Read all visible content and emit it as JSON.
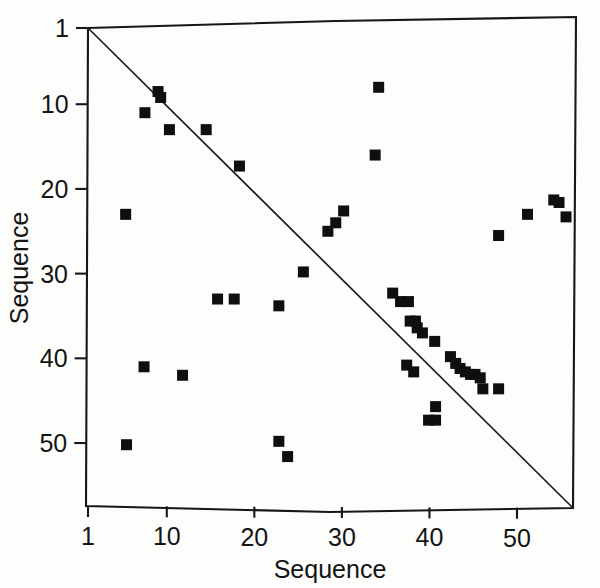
{
  "figure": {
    "kind": "sequence-dot-plot",
    "background_color": "#fdfdfb",
    "ink_color": "#0d0f10"
  },
  "axes": {
    "x_title": "Sequence",
    "y_title": "Sequence",
    "x_tick_labels": [
      "1",
      "10",
      "20",
      "30",
      "40",
      "50"
    ],
    "y_tick_labels": [
      "1",
      "10",
      "20",
      "30",
      "40",
      "50"
    ]
  },
  "chart_data": {
    "type": "scatter",
    "title": "",
    "xlabel": "Sequence",
    "ylabel": "Sequence",
    "xlim": [
      1,
      56
    ],
    "ylim": [
      1,
      55
    ],
    "y_axis_inverted": true,
    "grid": false,
    "legend": "none",
    "xticks": [
      1,
      10,
      20,
      30,
      40,
      50
    ],
    "yticks": [
      1,
      10,
      20,
      30,
      40,
      50
    ],
    "annotations": [
      {
        "name": "identity-diagonal",
        "kind": "line",
        "from": [
          1,
          1
        ],
        "to": [
          56,
          55
        ]
      }
    ],
    "marker": {
      "shape": "square",
      "size_px": 11,
      "color": "#0d0f10"
    },
    "points": [
      [
        9,
        8.5
      ],
      [
        9.3,
        9.2
      ],
      [
        7.5,
        11
      ],
      [
        10.3,
        13
      ],
      [
        14.5,
        13
      ],
      [
        18.3,
        17.3
      ],
      [
        34.2,
        8
      ],
      [
        33.8,
        16
      ],
      [
        5.3,
        23
      ],
      [
        28.4,
        25
      ],
      [
        29.3,
        24
      ],
      [
        30.2,
        22.6
      ],
      [
        47.9,
        25.5
      ],
      [
        51.2,
        23
      ],
      [
        54.2,
        21.3
      ],
      [
        54.8,
        21.6
      ],
      [
        55.6,
        23.3
      ],
      [
        25.6,
        29.8
      ],
      [
        15.8,
        33
      ],
      [
        17.7,
        33
      ],
      [
        22.8,
        33.8
      ],
      [
        35.8,
        32.3
      ],
      [
        36.7,
        33.3
      ],
      [
        37.6,
        33.3
      ],
      [
        37.8,
        35.6
      ],
      [
        38.4,
        35.6
      ],
      [
        38.6,
        36.4
      ],
      [
        39.2,
        37
      ],
      [
        40.6,
        38
      ],
      [
        37.4,
        40.8
      ],
      [
        38.2,
        41.6
      ],
      [
        42.4,
        39.8
      ],
      [
        43.0,
        40.6
      ],
      [
        43.5,
        41.2
      ],
      [
        44.1,
        41.6
      ],
      [
        44.7,
        41.9
      ],
      [
        45.2,
        41.9
      ],
      [
        45.8,
        42.3
      ],
      [
        46.1,
        43.6
      ],
      [
        47.9,
        43.6
      ],
      [
        7.4,
        41
      ],
      [
        11.8,
        42
      ],
      [
        40.7,
        45.7
      ],
      [
        39.9,
        47.3
      ],
      [
        40.7,
        47.3
      ],
      [
        5.4,
        50.2
      ],
      [
        22.8,
        49.8
      ],
      [
        23.8,
        51.6
      ]
    ]
  },
  "geometry": {
    "plot_left_px": 88,
    "plot_top_px": 28,
    "x_unit_px": 8.755,
    "y_unit_px": 8.47
  }
}
